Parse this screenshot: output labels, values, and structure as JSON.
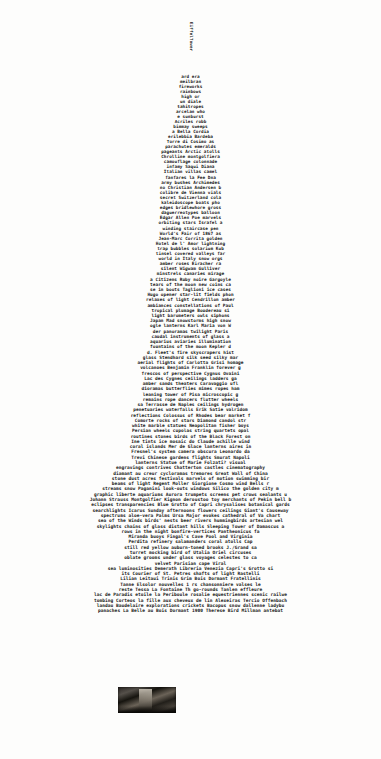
{
  "artwork": {
    "title": "Eiffel Tower typographic poem",
    "subject": "eiffel-tower",
    "medium": "typographic / concrete poetry print",
    "ink_color": "#151515",
    "paper_color": "#fdfdfc"
  },
  "mast": {
    "lines": [
      "Eiffel",
      "Tower"
    ]
  },
  "tower": {
    "bands": [
      {
        "name": "summit",
        "lines": [
          "ard era",
          "meilbran",
          "fireworks",
          "rainbows",
          "high or",
          "un diale",
          "tahitropes",
          "arcelan who",
          "e sunburst",
          "Acriles robb",
          "bimmay sweeps",
          "a Bella Cordia",
          "erilebbia Bardeba",
          "Torre di Cosimo as"
        ]
      },
      {
        "name": "upper-platform",
        "lines": [
          "parachutes emeralds",
          "pageants Arctic atolls",
          "Chrolline montgolfiera",
          "camouflage colonnade",
          "infamy Saqui  Diana",
          "Italian villas camel",
          "fanfares la Fee Dna",
          "army bushes Archimedes",
          "no Christian Andersen b",
          "colibre de Vienna vials",
          "secret Switzerland cola",
          "kaleidoscope boats pho",
          "edges bridlewhore gross",
          "daguerreotypes balloon",
          "Edgar Allen Poe marvels",
          "orbiting stars Israfel a",
          "winding staircase pen",
          "World's Fair of 1867 as",
          "Jean-Marc Corrita golden",
          "Hotel de l' Amor lightning",
          "trap bubbles solarium Kub",
          "tinsel covered valleys far",
          "world in Italy snow orgs",
          "amber roses Eiracher ra"
        ]
      },
      {
        "name": "mid-shaft",
        "lines": [
          "silent Wigwam Gulliver",
          "minstrels  canaries mirage",
          "a Citizens Ruby noire Gargoyle",
          "tears of the moon new coins ca",
          "se in boots Taglioni ice cases",
          "Hugo opener star-lit fields phon",
          "relaxes of light Cendrillon amber",
          "ambiances constellations of Paul",
          "tropical plumage Boudereau si",
          "light barometers owls siphons",
          "Japan Mad snowstorms high snow",
          "ogle lanterns Karl Maria von W",
          "der panoramas twilight Paris",
          "caudal instruments of glass a",
          "aquarius aviaries illumination",
          "fountains of the moon Kepler d"
        ]
      },
      {
        "name": "lower-shaft",
        "lines": [
          "d. Fleet's fire skyscrapers hist",
          "glass Stendhard silk seed silky mar",
          "aerial flights of Carlotta Grisi homage",
          "volcanoes Benjamin Franklin forever g",
          "frescos of perspective Cygnus Ovaini",
          "Lac des Cygnes ceilings ladders ga",
          "amber sands theaters Caravaggio ufl",
          "dioramas butterflies mimes ropes ham",
          "leaning tower of Pisa microscopic g",
          "remains rope dancers flutter wheels",
          "sa Terrasse de Naples ceilings hydrogen",
          "penetuaries waterfalls Erik Satie valridom",
          "reflections Colossus of Rhodes bear market f",
          "Comorte rocks of stars Diamond candol str",
          "white marble statues Neapolitan fisher boys",
          "Persian wheels cupolas string quartets opal",
          "routines stones birds of the Black Forest on"
        ]
      },
      {
        "name": "legs",
        "lines": [
          "Ine tints ice mosaic do Claude achille wind",
          "coral islands Mer de Glace lanterns aires in",
          "Fresnel's system camera obscura Leonardo da",
          "Trevi Chinese gardens flights Smurat Napoli",
          "lanterns Statue of Marie Folzati? visual",
          "engravings contrives Chatterton castles cinematography",
          "diamant au creur cycloramas tremores Great Wall of China",
          "stone dust acres festivals marvels of motion swimming bir",
          "beams of light Regent Moller Giorgione Cosmo wind Bells r",
          "streams snow Paganini look-outs windows Silico the golden city m",
          "graphic liberte aquariums Aurora trumpets screens pet crows sealants u",
          "Johann Strauss Montgolfier Kignon deroustoo toy merchants of Pekin bell b",
          "eclipses transparencies Blue Grotto of Capri chrysalises botanical gards",
          "searchlights Icarus Sunday afternoons flowers ceilings Giant's Causeway",
          "spectrums aloe-vera Palms Ursa Major evokes cathedral of Va  chart",
          "sea of the Winds birds' nests beer rivers hummingbirds artesian wel",
          "skylights chains of glass distant hills Sleeping Tower of Damascus a"
        ]
      },
      {
        "name": "base",
        "lines": [
          "rows in the night bonfire-vertices Pantheonicus fa",
          "Miranda buoys Fingal's Cave Pool and Virginia",
          "Perdita refinery salamanders coral atolls Cap",
          "still red yellow auburn-toned brooks J./Grand sa",
          "turret mocking bird of Utalia Oriel circuses",
          "oblate grooms under glass voyages celestes to ca",
          "velvet Parisian cape Viral",
          "sea luminosities Demerath Libreria Venezia Capri's Grotto si",
          "its Courier of St. Petres                    shafts of light Rastelli",
          "Lilian Leitaui Trinis Grim                   Bois Dormant Fratellinis",
          "Tanne Elsolor nouvelles 1                  rs chansonniere valses le",
          "reste Tessa La Fontaine  Th        go-rounds Tanlen effleure",
          "lac de Paradis etoile la Periboule rosalie equestriennes scenic railwe",
          "tombing Corteos la fille aux cheveux de lin Alexeiras Tercio Offenbach",
          "landau Baudelaire explorations crickets Bacopus snow dallenne ladybu",
          "panaches La Belle au Bois Dormant 1900 Therese Bird Millman antebat"
        ]
      }
    ]
  },
  "photograph": {
    "name": "inset-vintage-photo",
    "description": "small dark halftone photograph inset into the text",
    "tone": "#2b2724"
  },
  "caption": {
    "text": ""
  }
}
